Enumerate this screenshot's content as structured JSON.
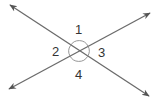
{
  "figure": {
    "type": "intersecting-lines-angles",
    "line_color": "#6b6b6b",
    "background": "#ffffff",
    "lines": [
      {
        "name": "line-a",
        "from": [
          10,
          5
        ],
        "to": [
          149,
          96
        ]
      },
      {
        "name": "line-b",
        "from": [
          9,
          89
        ],
        "to": [
          150,
          13
        ]
      }
    ],
    "intersection": [
      79,
      51
    ],
    "angle_labels": [
      {
        "id": "1",
        "text": "1",
        "position": "top"
      },
      {
        "id": "2",
        "text": "2",
        "position": "left"
      },
      {
        "id": "3",
        "text": "3",
        "position": "right"
      },
      {
        "id": "4",
        "text": "4",
        "position": "bottom"
      }
    ]
  }
}
